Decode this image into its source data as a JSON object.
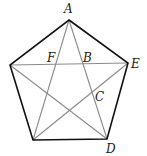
{
  "diagram": {
    "type": "regular pentagon with inscribed pentagram (all diagonals)",
    "colors": {
      "edge": "#111111",
      "diagonal": "#8a8a8a",
      "label": "#222222",
      "background": "#ffffff"
    },
    "vertices": {
      "A": {
        "x": 69,
        "y": 20,
        "label": "A",
        "label_x": 64,
        "label_y": 13
      },
      "L": {
        "x": 10,
        "y": 65,
        "label": "",
        "label_x": 0,
        "label_y": 0
      },
      "E": {
        "x": 128,
        "y": 63,
        "label": "E",
        "label_x": 131,
        "label_y": 68
      },
      "D": {
        "x": 107,
        "y": 139,
        "label": "D",
        "label_x": 106,
        "label_y": 153
      },
      "M": {
        "x": 33,
        "y": 140,
        "label": "",
        "label_x": 0,
        "label_y": 0
      }
    },
    "points": {
      "F": {
        "label": "F",
        "label_x": 47,
        "label_y": 62
      },
      "B": {
        "label": "B",
        "label_x": 83,
        "label_y": 62
      },
      "C": {
        "label": "C",
        "label_x": 95,
        "label_y": 101
      }
    },
    "edges": [
      [
        "A",
        "E"
      ],
      [
        "E",
        "D"
      ],
      [
        "D",
        "M"
      ],
      [
        "M",
        "L"
      ],
      [
        "L",
        "A"
      ]
    ],
    "diagonals": [
      [
        "A",
        "D"
      ],
      [
        "A",
        "M"
      ],
      [
        "L",
        "E"
      ],
      [
        "L",
        "D"
      ],
      [
        "E",
        "M"
      ]
    ]
  }
}
